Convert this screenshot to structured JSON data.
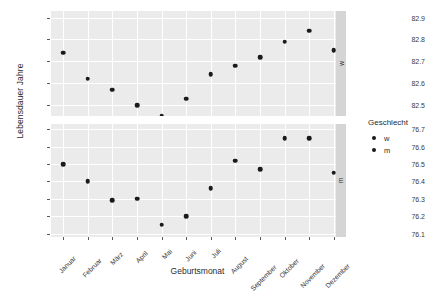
{
  "chart_data": {
    "type": "scatter",
    "title": "",
    "xlabel": "Geburtsmonat",
    "ylabel": "Lebensdauer Jahre",
    "categories": [
      "Januar",
      "Februar",
      "März",
      "April",
      "Mai",
      "Juni",
      "Juli",
      "August",
      "September",
      "Oktober",
      "November",
      "Dezember"
    ],
    "grid": true,
    "legend": {
      "title": "Geschlecht",
      "position": "right",
      "entries": [
        {
          "label": "w",
          "marker": "circle",
          "color": "#1a1a1a"
        },
        {
          "label": "m",
          "marker": "circle",
          "color": "#1a1a1a"
        }
      ]
    },
    "facets": [
      {
        "strip_label": "w",
        "ylim": [
          82.45,
          82.93
        ],
        "yticks": [
          "82.9",
          "82.8",
          "82.7",
          "82.6",
          "82.5"
        ],
        "ytick_values": [
          82.9,
          82.8,
          82.7,
          82.6,
          82.5
        ],
        "series": [
          {
            "name": "w",
            "values": [
              82.74,
              82.62,
              82.57,
              82.5,
              82.45,
              82.53,
              82.64,
              82.68,
              82.72,
              82.79,
              82.84,
              82.75
            ]
          }
        ]
      },
      {
        "strip_label": "m",
        "ylim": [
          76.08,
          76.73
        ],
        "yticks": [
          "76.7",
          "76.6",
          "76.5",
          "76.4",
          "76.3",
          "76.2",
          "76.1"
        ],
        "ytick_values": [
          76.7,
          76.6,
          76.5,
          76.4,
          76.3,
          76.2,
          76.1
        ],
        "series": [
          {
            "name": "m",
            "values": [
              76.5,
              76.4,
              76.29,
              76.3,
              76.15,
              76.2,
              76.36,
              76.52,
              76.47,
              76.65,
              76.65,
              76.45
            ]
          }
        ]
      }
    ]
  },
  "style": {
    "panel_bg": "#ebebeb",
    "strip_bg": "#d5d5d5",
    "point_color": "#1a1a1a",
    "grid_major": "#ffffff",
    "grid_minor": "#f6f6f6",
    "plot_bg": "#ffffff",
    "text_color": "#2b2b2b"
  }
}
